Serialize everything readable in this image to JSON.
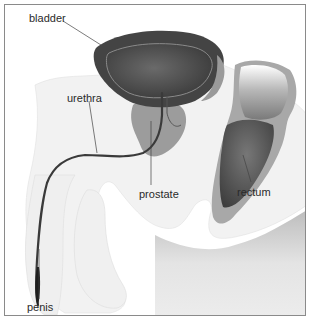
{
  "diagram": {
    "labels": {
      "bladder": "bladder",
      "urethra": "urethra",
      "prostate": "prostate",
      "rectum": "rectum",
      "penis": "penis"
    },
    "colors": {
      "border": "#8a8a8a",
      "body": "#f2f2f2",
      "body_shadow": "#cfcfcf",
      "bladder_wall": "#4a4a4a",
      "bladder_inner": "#5c5c5c",
      "prostate": "#9c9c9c",
      "rectum_wall": "#a8a8a8",
      "rectum_inner": "#6a6a6a",
      "urethra": "#3a3a3a",
      "leader_line": "#444444",
      "label_text": "#2a2a2a"
    }
  }
}
